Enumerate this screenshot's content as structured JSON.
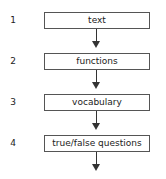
{
  "steps": [
    {
      "number": "1",
      "label": "text"
    },
    {
      "number": "2",
      "label": "functions"
    },
    {
      "number": "3",
      "label": "vocabulary"
    },
    {
      "number": "4",
      "label": "true/false questions"
    }
  ]
}
